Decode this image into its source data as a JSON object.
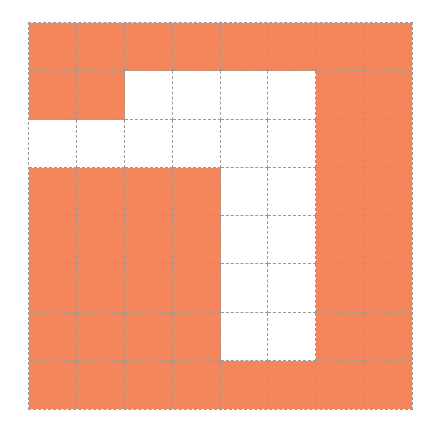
{
  "grid": {
    "rows": 8,
    "cols": 8,
    "filled_color": "#f5855b",
    "empty_color": "#ffffff",
    "line_color": "#a09a92",
    "cells": [
      [
        1,
        1,
        1,
        1,
        1,
        1,
        1,
        1
      ],
      [
        1,
        1,
        0,
        0,
        0,
        0,
        1,
        1
      ],
      [
        0,
        0,
        0,
        0,
        0,
        0,
        1,
        1
      ],
      [
        1,
        1,
        1,
        1,
        0,
        0,
        1,
        1
      ],
      [
        1,
        1,
        1,
        1,
        0,
        0,
        1,
        1
      ],
      [
        1,
        1,
        1,
        1,
        0,
        0,
        1,
        1
      ],
      [
        1,
        1,
        1,
        1,
        0,
        0,
        1,
        1
      ],
      [
        1,
        1,
        1,
        1,
        1,
        1,
        1,
        1
      ]
    ]
  }
}
